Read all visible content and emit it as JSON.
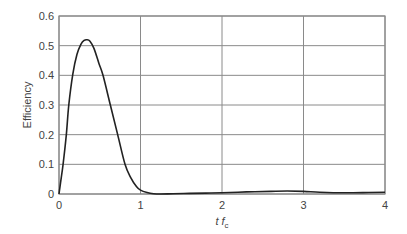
{
  "chart_data": {
    "type": "line",
    "title": "",
    "xlabel": "t f_c",
    "xlabel_main": "t f",
    "xlabel_sub": "c",
    "ylabel": "Efficiency",
    "xlim": [
      0,
      4
    ],
    "ylim": [
      0,
      0.6
    ],
    "grid": true,
    "legend": null,
    "x_ticks": [
      0,
      1,
      2,
      3,
      4
    ],
    "x_tick_labels": [
      "0",
      "1",
      "2",
      "3",
      "4"
    ],
    "y_ticks": [
      0,
      0.1,
      0.2,
      0.3,
      0.4,
      0.5,
      0.6
    ],
    "y_tick_labels": [
      "0",
      "0.1",
      "0.2",
      "0.3",
      "0.4",
      "0.5",
      "0.6"
    ],
    "series": [
      {
        "name": "Efficiency",
        "color": "#222222",
        "x": [
          0,
          0.02,
          0.05,
          0.09,
          0.12,
          0.17,
          0.22,
          0.27,
          0.31,
          0.34,
          0.38,
          0.43,
          0.49,
          0.54,
          0.63,
          0.72,
          0.81,
          0.88,
          0.95,
          1.0,
          1.08,
          1.16,
          1.25,
          1.4,
          1.6,
          1.8,
          2.0,
          2.3,
          2.6,
          2.8,
          3.0,
          3.2,
          3.5,
          3.8,
          4.0
        ],
        "y": [
          0,
          0.04,
          0.1,
          0.2,
          0.3,
          0.405,
          0.47,
          0.505,
          0.518,
          0.52,
          0.515,
          0.49,
          0.44,
          0.4,
          0.3,
          0.2,
          0.1,
          0.055,
          0.025,
          0.013,
          0.005,
          0.001,
          0.0,
          0.001,
          0.002,
          0.003,
          0.004,
          0.007,
          0.009,
          0.01,
          0.009,
          0.006,
          0.004,
          0.005,
          0.006
        ]
      }
    ]
  },
  "colors": {
    "grid": "#8a8a8a",
    "axis": "#8a8a8a",
    "line": "#222222",
    "text": "#444444"
  }
}
